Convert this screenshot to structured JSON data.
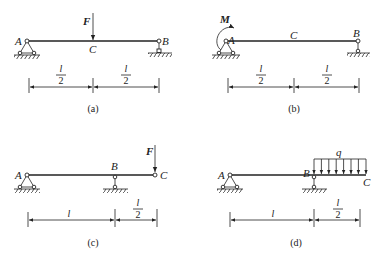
{
  "figure": {
    "panels": [
      {
        "caption": "(a)",
        "labels": {
          "A": "A",
          "B": "B",
          "C": "C",
          "load": "F"
        },
        "load_type": "point-force-at-midspan",
        "supports": {
          "A": "pin",
          "B": "roller"
        },
        "dimensions": [
          {
            "num": "l",
            "den": "2"
          },
          {
            "num": "l",
            "den": "2"
          }
        ]
      },
      {
        "caption": "(b)",
        "labels": {
          "A": "A",
          "B": "B",
          "C": "C",
          "load": "M"
        },
        "load_type": "moment-at-A",
        "supports": {
          "A": "pin",
          "B": "roller"
        },
        "dimensions": [
          {
            "num": "l",
            "den": "2"
          },
          {
            "num": "l",
            "den": "2"
          }
        ]
      },
      {
        "caption": "(c)",
        "labels": {
          "A": "A",
          "B": "B",
          "C": "C",
          "load": "F"
        },
        "load_type": "point-force-at-overhang-end",
        "supports": {
          "A": "pin",
          "B": "roller"
        },
        "dimensions": [
          {
            "num": "l",
            "den": ""
          },
          {
            "num": "l",
            "den": "2"
          }
        ]
      },
      {
        "caption": "(d)",
        "labels": {
          "A": "A",
          "B": "B",
          "C": "C",
          "load": "q"
        },
        "load_type": "distributed-load-on-overhang",
        "supports": {
          "A": "pin",
          "B": "roller"
        },
        "dimensions": [
          {
            "num": "l",
            "den": ""
          },
          {
            "num": "l",
            "den": "2"
          }
        ]
      }
    ]
  }
}
